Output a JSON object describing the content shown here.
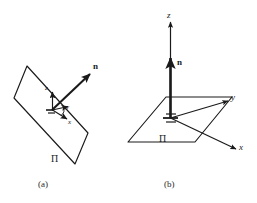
{
  "figure": {
    "background_color": "#ffffff",
    "stroke_color": "#1a1a1a",
    "panels": [
      {
        "id": "a",
        "caption": "(a)",
        "plane_label": "Π",
        "normal_label": "n",
        "axis_labels": {
          "x": "x",
          "y": "y",
          "z": "z"
        },
        "description": "tilted-plane-with-local-frame"
      },
      {
        "id": "b",
        "caption": "(b)",
        "plane_label": "Π",
        "normal_label": "n",
        "axis_labels": {
          "x": "x",
          "y": "y",
          "z": "z"
        },
        "description": "horizontal-plane-with-global-axes"
      }
    ]
  }
}
